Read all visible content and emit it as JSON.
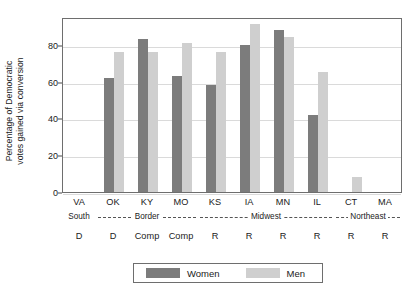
{
  "chart_data": {
    "type": "bar",
    "title": "",
    "xlabel": "",
    "ylabel": "Percentage of Democratic votes gained via conversion",
    "ylabel_lines": [
      "Percentage of Democratic",
      "votes gained via conversion"
    ],
    "ylim": [
      0,
      95
    ],
    "yticks": [
      0,
      20,
      40,
      60,
      80
    ],
    "grid": true,
    "legend_position": "bottom-center",
    "categories": [
      "VA",
      "OK",
      "KY",
      "MO",
      "KS",
      "IA",
      "MN",
      "IL",
      "CT",
      "MA"
    ],
    "series": [
      {
        "name": "Women",
        "color": "#7c7c7c",
        "values": [
          null,
          62,
          83,
          63,
          58,
          80,
          88,
          42,
          null,
          null
        ]
      },
      {
        "name": "Men",
        "color": "#cfcfcf",
        "values": [
          null,
          76,
          76,
          81,
          76,
          91,
          84,
          65,
          8,
          null
        ]
      }
    ],
    "party_row": [
      "D",
      "D",
      "Comp",
      "Comp",
      "R",
      "R",
      "R",
      "R",
      "R",
      "R"
    ],
    "regions": [
      {
        "label": "South",
        "start": 0,
        "end": 0,
        "dashed": false
      },
      {
        "label": "Border",
        "start": 1,
        "end": 3,
        "dashed": true
      },
      {
        "label": "Midwest",
        "start": 4,
        "end": 7,
        "dashed": true
      },
      {
        "label": "Northeast",
        "start": 8,
        "end": 9,
        "dashed": true
      }
    ]
  },
  "legend": {
    "women_label": "Women",
    "men_label": "Men"
  }
}
